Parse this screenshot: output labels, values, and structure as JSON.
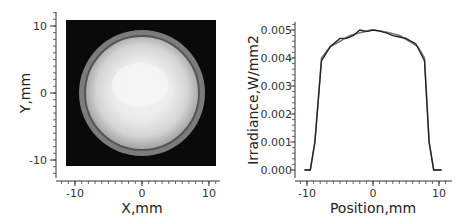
{
  "chart_data": [
    {
      "type": "heatmap",
      "title": "",
      "xlabel": "X,mm",
      "ylabel": "Y,mm",
      "xlim": [
        -11,
        11
      ],
      "ylim": [
        -11,
        11
      ],
      "x_ticks": [
        "-10",
        "0",
        "10"
      ],
      "y_ticks": [
        "10",
        "0",
        "-10"
      ],
      "description": "Grayscale irradiance map: bright circular disk (radius ~9.5 mm) centered at (0,0) on black background, with gray outer ring and darker inner ring near edge",
      "disk_center": [
        0,
        0
      ],
      "disk_radius_mm": 9.4
    },
    {
      "type": "line",
      "title": "",
      "xlabel": "Position,mm",
      "ylabel": "Irradiance,W/mm2",
      "xlim": [
        -11,
        11
      ],
      "ylim": [
        0,
        0.005
      ],
      "x_ticks": [
        "-10",
        "0",
        "10"
      ],
      "y_ticks": [
        "0.000",
        "0.001",
        "0.002",
        "0.003",
        "0.004",
        "0.005"
      ],
      "series": [
        {
          "name": "profile-smooth",
          "x": [
            -10,
            -9.5,
            -8.8,
            -7.8,
            -6.5,
            -5,
            -3.5,
            -2,
            -0.5,
            0,
            1,
            2.5,
            4,
            5.5,
            6.8,
            7.8,
            8.5,
            9.2,
            10
          ],
          "y": [
            0,
            0,
            0.001,
            0.004,
            0.0044,
            0.0046,
            0.0048,
            0.0049,
            0.00498,
            0.005,
            0.00497,
            0.0049,
            0.0048,
            0.0046,
            0.0044,
            0.004,
            0.001,
            0,
            0
          ]
        },
        {
          "name": "profile-measured",
          "x": [
            -10,
            -9.5,
            -8.8,
            -7.8,
            -6.5,
            -5,
            -4,
            -3,
            -2,
            -1,
            0,
            1,
            2,
            3,
            4,
            5,
            6.5,
            7.8,
            8.5,
            9.2,
            10
          ],
          "y": [
            0,
            0,
            0.001,
            0.0039,
            0.0044,
            0.0047,
            0.0047,
            0.0048,
            0.005,
            0.00495,
            0.005,
            0.00496,
            0.0049,
            0.0048,
            0.00475,
            0.0047,
            0.0045,
            0.0039,
            0.001,
            0,
            0
          ]
        }
      ]
    }
  ],
  "left": {
    "xlabel": "X,mm",
    "ylabel": "Y,mm",
    "x_ticks": [
      "-10",
      "0",
      "10"
    ],
    "y_ticks": [
      "10",
      "0",
      "-10"
    ]
  },
  "right": {
    "xlabel": "Position,mm",
    "ylabel": "Irradiance,W/mm2",
    "x_ticks": [
      "-10",
      "0",
      "10"
    ],
    "y_ticks": [
      "0.005",
      "0.004",
      "0.003",
      "0.002",
      "0.001",
      "0.000"
    ]
  }
}
